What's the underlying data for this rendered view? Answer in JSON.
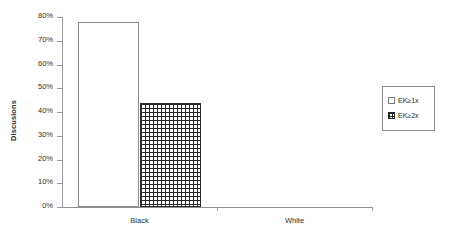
{
  "chart_data": {
    "type": "bar",
    "title": "",
    "subtitle": "",
    "xlabel": "",
    "ylabel": "Discusions",
    "categories": [
      "Black",
      "White"
    ],
    "series": [
      {
        "name": "EK≥1x",
        "values": [
          78,
          0
        ],
        "swatch": "open-white-square"
      },
      {
        "name": "EK≥2x",
        "values": [
          44,
          0
        ],
        "swatch": "crosshatch-grid-square"
      }
    ],
    "ylim": [
      0,
      80
    ],
    "ytick_labels": [
      "0%",
      "10%",
      "20%",
      "30%",
      "40%",
      "50%",
      "60%",
      "70%",
      "80%"
    ],
    "ytick_values": [
      0,
      10,
      20,
      30,
      40,
      50,
      60,
      70,
      80
    ],
    "grid": false,
    "legend_position": "right",
    "value_suffix": "%"
  },
  "legend": {
    "entries": [
      {
        "label": "EK≥1x"
      },
      {
        "label": "EK≥2x"
      }
    ]
  }
}
